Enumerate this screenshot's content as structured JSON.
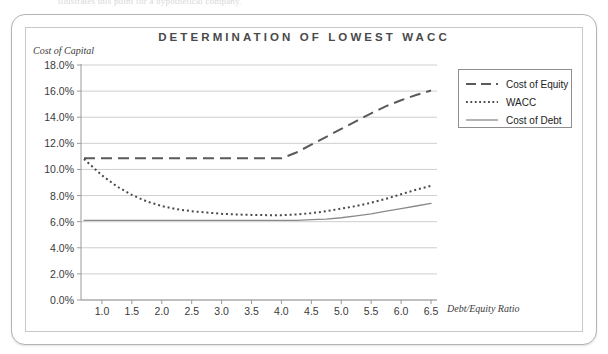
{
  "top_cut_text": "illustrates this point for a hypothetical company.",
  "frame": {
    "outer_border_color": "#b4b4b4",
    "inner_border_color": "#c8c8c8"
  },
  "chart_data": {
    "type": "line",
    "title": "DETERMINATION OF LOWEST WACC",
    "ylabel": "Cost of Capital",
    "xlabel": "Debt/Equity Ratio",
    "grid": true,
    "legend_position": "top-right",
    "xlim": [
      0.65,
      6.6
    ],
    "ylim": [
      0.0,
      18.0
    ],
    "ytick_labels": [
      "18.0%",
      "16.0%",
      "14.0%",
      "12.0%",
      "10.0%",
      "8.0%",
      "6.0%",
      "4.0%",
      "2.0%",
      "0.0%"
    ],
    "ytick_values": [
      18.0,
      16.0,
      14.0,
      12.0,
      10.0,
      8.0,
      6.0,
      4.0,
      2.0,
      0.0
    ],
    "xtick_labels": [
      "1.0",
      "1.5",
      "2.0",
      "2.5",
      "3.0",
      "3.5",
      "4.0",
      "4.5",
      "5.0",
      "5.5",
      "6.0",
      "6.5"
    ],
    "xtick_values": [
      1.0,
      1.5,
      2.0,
      2.5,
      3.0,
      3.5,
      4.0,
      4.5,
      5.0,
      5.5,
      6.0,
      6.5
    ],
    "x": [
      0.7,
      1.0,
      1.25,
      1.5,
      1.75,
      2.0,
      2.25,
      2.5,
      2.75,
      3.0,
      3.25,
      3.5,
      3.75,
      4.0,
      4.25,
      4.5,
      4.75,
      5.0,
      5.25,
      5.5,
      5.75,
      6.0,
      6.25,
      6.5
    ],
    "series": [
      {
        "name": "Cost of Equity",
        "style": "dashed",
        "color": "#5a5a5a",
        "values": [
          10.85,
          10.85,
          10.85,
          10.85,
          10.85,
          10.85,
          10.85,
          10.85,
          10.85,
          10.85,
          10.85,
          10.85,
          10.85,
          10.85,
          11.3,
          11.9,
          12.5,
          13.1,
          13.7,
          14.3,
          14.85,
          15.3,
          15.7,
          16.05
        ]
      },
      {
        "name": "WACC",
        "style": "dotted",
        "color": "#4a4a4a",
        "values": [
          10.8,
          9.55,
          8.7,
          8.05,
          7.55,
          7.2,
          6.95,
          6.8,
          6.7,
          6.6,
          6.55,
          6.52,
          6.5,
          6.5,
          6.55,
          6.65,
          6.8,
          7.0,
          7.2,
          7.45,
          7.75,
          8.1,
          8.45,
          8.75
        ]
      },
      {
        "name": "Cost of Debt",
        "style": "solid",
        "color": "#8a8a8a",
        "values": [
          6.1,
          6.1,
          6.1,
          6.1,
          6.1,
          6.1,
          6.1,
          6.1,
          6.1,
          6.1,
          6.1,
          6.1,
          6.1,
          6.1,
          6.1,
          6.15,
          6.2,
          6.3,
          6.45,
          6.6,
          6.8,
          7.0,
          7.2,
          7.4
        ]
      }
    ]
  },
  "legend": {
    "items": [
      {
        "label": "Cost of Equity",
        "style": "dashed"
      },
      {
        "label": "WACC",
        "style": "dotted"
      },
      {
        "label": "Cost of Debt",
        "style": "solid"
      }
    ]
  }
}
